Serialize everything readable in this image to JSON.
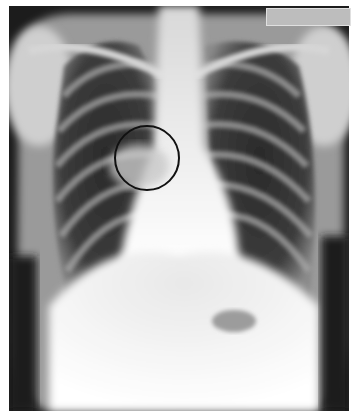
{
  "image": {
    "subject": "chest-x-ray-pa-view",
    "width": 360,
    "height": 420,
    "background": "#ffffff"
  },
  "annotation": {
    "shape": "circle",
    "cx": 147,
    "cy": 158,
    "r": 33,
    "stroke": "#111111",
    "stroke_width": 2
  },
  "label_box": {
    "color": "#bdbdbd"
  }
}
